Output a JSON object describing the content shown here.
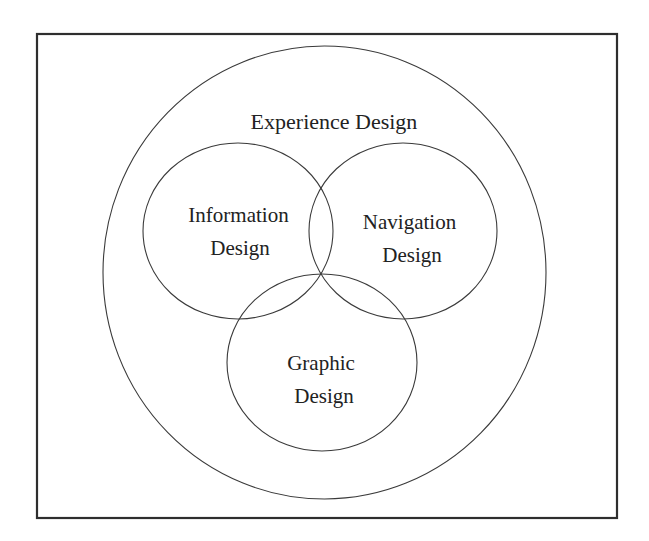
{
  "diagram": {
    "type": "venn",
    "outer_set": {
      "label": "Experience Design"
    },
    "inner_sets": [
      {
        "id": "information",
        "line1": "Information",
        "line2": "Design"
      },
      {
        "id": "navigation",
        "line1": "Navigation",
        "line2": "Design"
      },
      {
        "id": "graphic",
        "line1": "Graphic",
        "line2": "Design"
      }
    ],
    "colors": {
      "frame": "#2e2e2e",
      "stroke": "#3a3a3a",
      "text": "#222222",
      "background": "#ffffff"
    }
  }
}
